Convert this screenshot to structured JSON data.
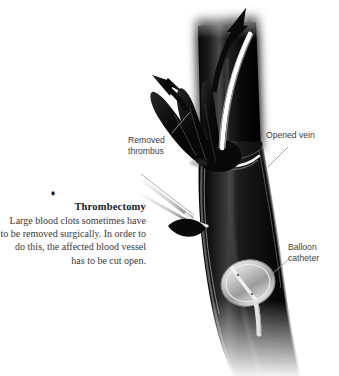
{
  "figure": {
    "kind": "medical-illustration",
    "background_color": "#ffffff"
  },
  "caption": {
    "bullet": "♦",
    "title": "Thrombectomy",
    "body": "Large blood clots sometimes have to be removed surgically. In order to do this, the affected blood vessel has to be cut open.",
    "text_color": "#2b2b2b",
    "align": "right"
  },
  "labels": [
    {
      "id": "removed-thrombus",
      "text": "Removed\nthrombus",
      "color": "#3d3d3d"
    },
    {
      "id": "opened-vein",
      "text": "Opened vein",
      "color": "#3d3d3d"
    },
    {
      "id": "balloon-catheter",
      "text": "Balloon\ncatheter",
      "color": "#3d3d3d"
    }
  ],
  "illustration": {
    "vessel_color": "#0b0b0b",
    "vessel_highlight": "#6e6e6e",
    "incision_color": "#f2f2f2",
    "guidewire_color": "#f4f4f4",
    "balloon_color": "#c9c9c9",
    "instrument_color": "#e8e8e8",
    "arrow_color": "#0b0b0b",
    "leader_line_color": "#9a9a9a",
    "parts": [
      {
        "name": "vein",
        "description": "large dark vein running top to bottom"
      },
      {
        "name": "removed-thrombus",
        "description": "dark lobed clot pulled out of the vein at upper left"
      },
      {
        "name": "opened-vein",
        "description": "white curved incision line across the vein"
      },
      {
        "name": "balloon-catheter",
        "description": "light grey oval balloon on a thin catheter inside the vein"
      },
      {
        "name": "guidewire",
        "description": "pale curved wire exiting the top of the vein"
      },
      {
        "name": "forceps",
        "description": "two thin pointed surgical prongs at the left"
      },
      {
        "name": "extraction-arrow-upper",
        "description": "black arrow pointing up along the guidewire"
      },
      {
        "name": "extraction-arrow-left",
        "description": "black arrow pointing up-left over the thrombus"
      }
    ]
  }
}
